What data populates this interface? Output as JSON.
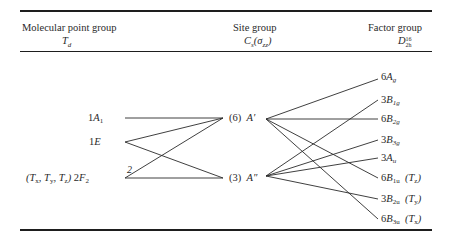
{
  "header": {
    "col1": {
      "title": "Molecular point group",
      "symbol": "Td"
    },
    "col2": {
      "title": "Site group",
      "symbol": "Cs(σzz)"
    },
    "col3": {
      "title": "Factor group",
      "symbol": "D2h16"
    }
  },
  "molecular": [
    {
      "id": "A1",
      "count": "1",
      "sym": "A",
      "sub": "1",
      "prefix": "",
      "y": 118
    },
    {
      "id": "E",
      "count": "1",
      "sym": "E",
      "sub": "",
      "prefix": "",
      "y": 142
    },
    {
      "id": "F2",
      "count": "2",
      "sym": "F",
      "sub": "2",
      "prefix": "(Tx, Ty, Tz)",
      "y": 178
    }
  ],
  "site": [
    {
      "id": "A1p",
      "count": "(6)",
      "sym": "A′",
      "y": 118
    },
    {
      "id": "A2p",
      "count": "(3)",
      "sym": "A″",
      "y": 178
    }
  ],
  "factor": [
    {
      "id": "Ag",
      "count": "6",
      "sym": "B",
      "label": "6Ag",
      "main": "A",
      "sub": "g",
      "note": "",
      "y": 77
    },
    {
      "id": "B1g",
      "count": "3",
      "label": "3B1g",
      "main": "B",
      "sub": "1g",
      "note": "",
      "y": 100
    },
    {
      "id": "B2g",
      "count": "6",
      "label": "6B2g",
      "main": "B",
      "sub": "2g",
      "note": "",
      "y": 119
    },
    {
      "id": "B3g",
      "count": "3",
      "label": "3B3g",
      "main": "B",
      "sub": "3g",
      "note": "",
      "y": 140
    },
    {
      "id": "Au",
      "count": "3",
      "label": "3Au",
      "main": "A",
      "sub": "u",
      "note": "",
      "y": 158
    },
    {
      "id": "B1u",
      "count": "6",
      "label": "6B1u (Tz)",
      "main": "B",
      "sub": "1u",
      "note": "(Tz)",
      "y": 178
    },
    {
      "id": "B2u",
      "count": "3",
      "label": "3B2u (Ty)",
      "main": "B",
      "sub": "2u",
      "note": "(Ty)",
      "y": 199
    },
    {
      "id": "B3u",
      "count": "6",
      "label": "6B3u (Tx)",
      "main": "B",
      "sub": "3u",
      "note": "(Tx)",
      "y": 219
    }
  ],
  "correlations_left": [
    [
      "A1",
      "A1p"
    ],
    [
      "E",
      "A1p"
    ],
    [
      "E",
      "A2p"
    ],
    [
      "F2",
      "A1p"
    ],
    [
      "F2",
      "A2p"
    ]
  ],
  "correlations_right": [
    [
      "A1p",
      "Ag"
    ],
    [
      "A1p",
      "B2g"
    ],
    [
      "A1p",
      "B1u"
    ],
    [
      "A1p",
      "B3u"
    ],
    [
      "A2p",
      "B1g"
    ],
    [
      "A2p",
      "B3g"
    ],
    [
      "A2p",
      "Au"
    ],
    [
      "A2p",
      "B2u"
    ]
  ],
  "annotation": "2"
}
